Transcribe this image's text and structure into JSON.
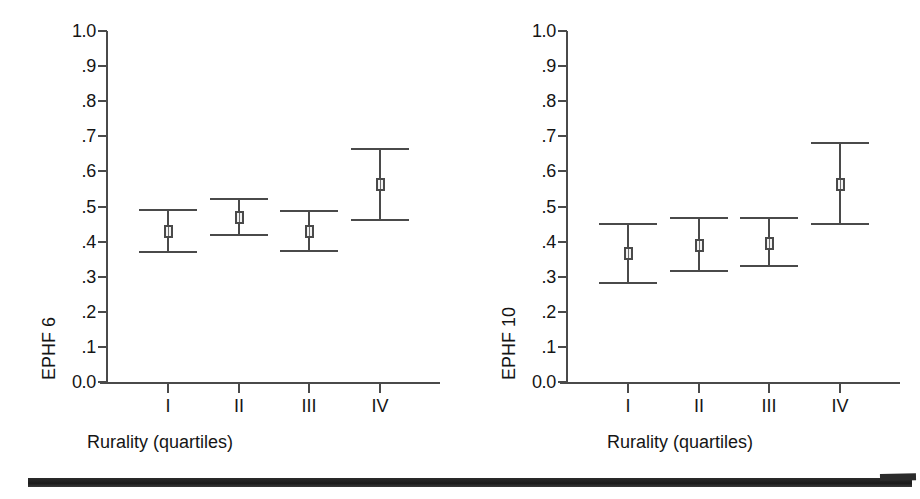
{
  "figure": {
    "background_color": "#ffffff",
    "line_color": "#4a4a4a",
    "text_color": "#151515",
    "scan_bar_color": "#1b1b1b"
  },
  "chart_data": [
    {
      "type": "scatter",
      "panel": "left",
      "title": "",
      "xlabel": "Rurality (quartiles)",
      "ylabel": "EPHF 6",
      "categories": [
        "I",
        "II",
        "III",
        "IV"
      ],
      "values": [
        0.43,
        0.47,
        0.43,
        0.565
      ],
      "ci_lower": [
        0.37,
        0.42,
        0.373,
        0.462
      ],
      "ci_upper": [
        0.49,
        0.521,
        0.487,
        0.665
      ],
      "ylim": [
        0.0,
        1.0
      ],
      "ytick_labels": [
        "0.0",
        ".1",
        ".2",
        ".3",
        ".4",
        ".5",
        ".6",
        ".7",
        ".8",
        ".9",
        "1.0"
      ],
      "ytick_values": [
        0.0,
        0.1,
        0.2,
        0.3,
        0.4,
        0.5,
        0.6,
        0.7,
        0.8,
        0.9,
        1.0
      ],
      "grid": false,
      "legend": null,
      "marker": "open-square",
      "error_bar_style": "capped"
    },
    {
      "type": "scatter",
      "panel": "right",
      "title": "",
      "xlabel": "Rurality (quartiles)",
      "ylabel": "EPHF 10",
      "categories": [
        "I",
        "II",
        "III",
        "IV"
      ],
      "values": [
        0.367,
        0.391,
        0.397,
        0.565
      ],
      "ci_lower": [
        0.281,
        0.316,
        0.331,
        0.449
      ],
      "ci_upper": [
        0.451,
        0.467,
        0.467,
        0.681
      ],
      "ylim": [
        0.0,
        1.0
      ],
      "ytick_labels": [
        "0.0",
        ".1",
        ".2",
        ".3",
        ".4",
        ".5",
        ".6",
        ".7",
        ".8",
        ".9",
        "1.0"
      ],
      "ytick_values": [
        0.0,
        0.1,
        0.2,
        0.3,
        0.4,
        0.5,
        0.6,
        0.7,
        0.8,
        0.9,
        1.0
      ],
      "grid": false,
      "legend": null,
      "marker": "open-square",
      "error_bar_style": "capped"
    }
  ]
}
